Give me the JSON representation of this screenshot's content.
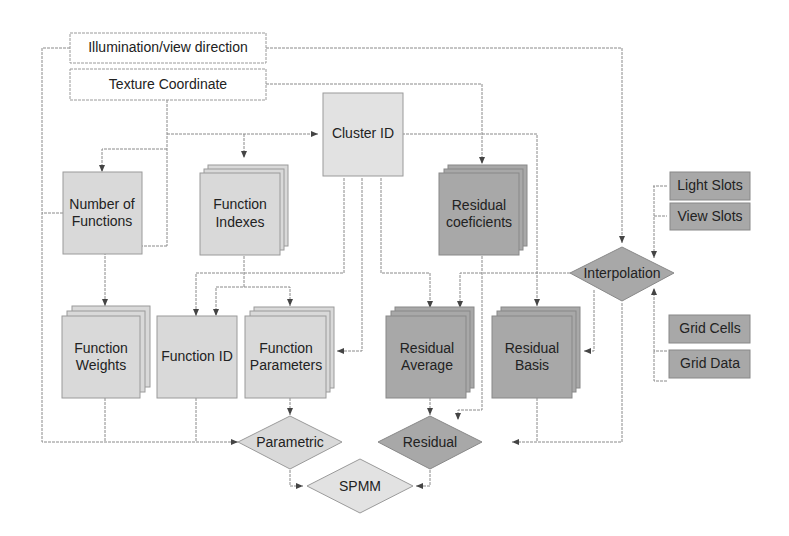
{
  "diagram": {
    "inputs": {
      "illumination": "Illumination/view direction",
      "texture": "Texture Coordinate"
    },
    "nodes": {
      "cluster_id": "Cluster ID",
      "number_of_functions": [
        "Number of",
        "Functions"
      ],
      "function_indexes": [
        "Function",
        "Indexes"
      ],
      "residual_coeficients": [
        "Residual",
        "coeficients"
      ],
      "function_weights": [
        "Function",
        "Weights"
      ],
      "function_id": "Function ID",
      "function_parameters": [
        "Function",
        "Parameters"
      ],
      "residual_average": [
        "Residual",
        "Average"
      ],
      "residual_basis": [
        "Residual",
        "Basis"
      ],
      "light_slots": "Light Slots",
      "view_slots": "View Slots",
      "grid_cells": "Grid Cells",
      "grid_data": "Grid Data"
    },
    "decisions": {
      "interpolation": "Interpolation",
      "parametric": "Parametric",
      "residual": "Residual",
      "spmm": "SPMM"
    },
    "colors": {
      "line": "#8a8a8a",
      "light_fill": "#d9d9d9",
      "cluster_fill": "#e2e2e2",
      "dark_fill": "#a8a8a8",
      "white_fill": "#ffffff"
    }
  }
}
